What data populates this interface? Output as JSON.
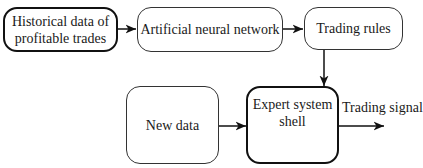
{
  "diagram": {
    "nodes": [
      {
        "id": "historical",
        "label_line1": "Historical data of",
        "label_line2": "profitable trades",
        "emphasis": "bold"
      },
      {
        "id": "ann",
        "label": "Artificial neural network",
        "emphasis": "normal"
      },
      {
        "id": "rules",
        "label": "Trading rules",
        "emphasis": "normal"
      },
      {
        "id": "newdata",
        "label": "New data",
        "emphasis": "normal"
      },
      {
        "id": "ess",
        "label_line1": "Expert system",
        "label_line2": "shell",
        "emphasis": "bold"
      }
    ],
    "edges": [
      {
        "from": "historical",
        "to": "ann"
      },
      {
        "from": "ann",
        "to": "rules"
      },
      {
        "from": "rules",
        "to": "ess"
      },
      {
        "from": "newdata",
        "to": "ess"
      },
      {
        "from": "ess",
        "to": "output",
        "label": "Trading signal"
      }
    ],
    "output_label": "Trading signal"
  }
}
